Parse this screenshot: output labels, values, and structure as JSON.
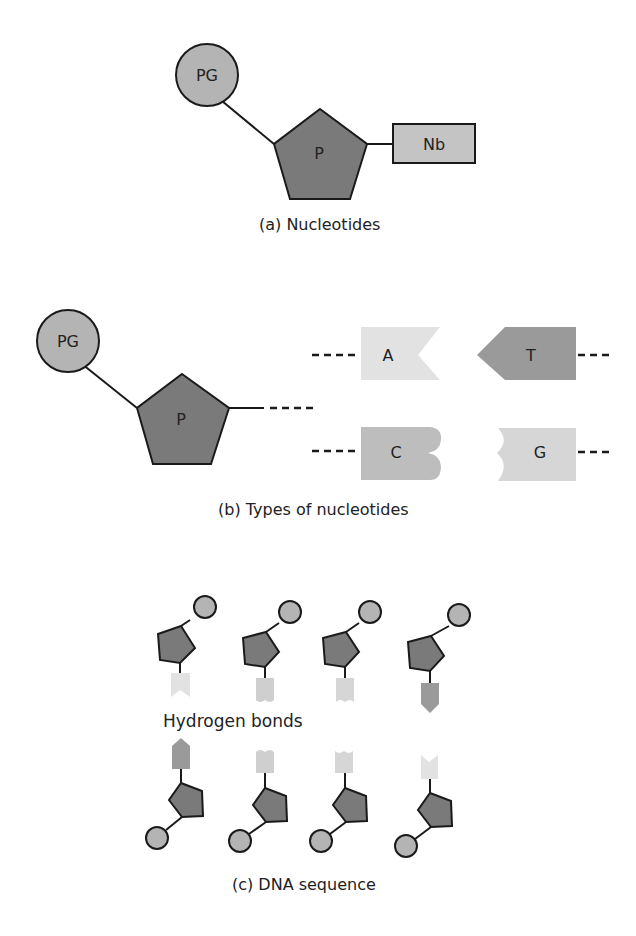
{
  "colors": {
    "phosphate": "#b4b4b4",
    "sugar": "#7a7a7a",
    "base_generic": "#c4c4c4",
    "adenine": "#e2e2e2",
    "thymine": "#9a9a9a",
    "cytosine": "#bdbdbd",
    "guanine": "#d6d6d6",
    "stroke": "#1a1a1a"
  },
  "panel_a": {
    "phosphate_label": "PG",
    "sugar_label": "P",
    "base_label": "Nb",
    "caption": "(a) Nucleotides"
  },
  "panel_b": {
    "phosphate_label": "PG",
    "sugar_label": "P",
    "bases": [
      {
        "label": "A"
      },
      {
        "label": "T"
      },
      {
        "label": "C"
      },
      {
        "label": "G"
      }
    ],
    "caption": "(b) Types of nucleotides"
  },
  "panel_c": {
    "top_strand": [
      "A",
      "C",
      "G",
      "T"
    ],
    "bottom_strand": [
      "T",
      "G",
      "C",
      "A"
    ],
    "annotation": "Hydrogen bonds",
    "caption": "(c) DNA sequence"
  }
}
